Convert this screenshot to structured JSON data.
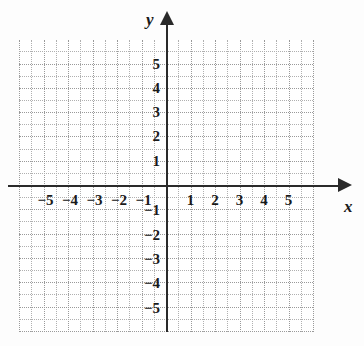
{
  "figure": {
    "type": "cartesian-coordinate-grid",
    "background_color": "#fdfdfd",
    "axis_color": "#2a2a2a",
    "grid_color": "#b0b0b0",
    "grid_major_color": "#9a9a9a",
    "label_color": "#1a1a1a"
  },
  "axes": {
    "x_label": "x",
    "y_label": "y",
    "x_arrow": "arrow-right",
    "y_arrow": "arrow-up"
  },
  "chart_data": {
    "type": "scatter",
    "title": "",
    "subtitle": "",
    "xlabel": "x",
    "ylabel": "y",
    "xlim": [
      -6,
      6
    ],
    "ylim": [
      -6,
      6
    ],
    "grid": true,
    "grid_minor_step": 0.5,
    "grid_major_step": 1,
    "legend": null,
    "series": [],
    "x_ticks": [
      -5,
      -4,
      -3,
      -2,
      -1,
      1,
      2,
      3,
      4,
      5
    ],
    "y_ticks": [
      5,
      4,
      3,
      2,
      1,
      -1,
      -2,
      -3,
      -4,
      -5
    ],
    "x_tick_labels": [
      "−5",
      "−4",
      "−3",
      "−2",
      "−1",
      "1",
      "2",
      "3",
      "4",
      "5"
    ],
    "y_tick_labels": [
      "5",
      "4",
      "3",
      "2",
      "1",
      "−1",
      "−2",
      "−3",
      "−4",
      "−5"
    ],
    "annotations": []
  }
}
